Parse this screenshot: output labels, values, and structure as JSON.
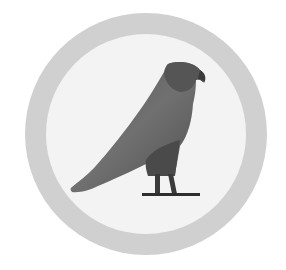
{
  "emblem": {
    "subject": "falcon-hieroglyph",
    "colors": {
      "background": "#ffffff",
      "ring": "#cfcfcf",
      "inner_disc": "#f2f2f2",
      "body_light": "#6e6e6e",
      "body_dark": "#4a4a4a",
      "perch": "#2e2e2e"
    }
  }
}
